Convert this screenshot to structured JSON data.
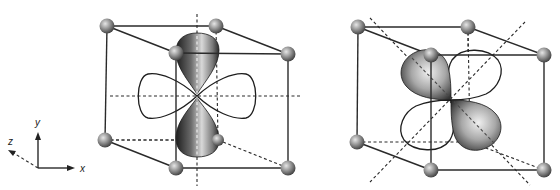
{
  "figure": {
    "panels": [
      {
        "id": "left",
        "orbital": "d_z2-like lobes along vertical axis with torus-like ring",
        "shaded_lobes": "up and down along y axis",
        "outlined_lobes": "left and right along x axis"
      },
      {
        "id": "right",
        "orbital": "d_xy-like lobes between axes",
        "shaded_lobes": "upper-left and lower-right diagonals",
        "outlined_lobes": "upper-right and lower-left diagonals"
      }
    ],
    "axes": {
      "x_label": "x",
      "y_label": "y",
      "z_label": "z"
    },
    "colors": {
      "line": "#2a2a2a",
      "atom_dark": "#3a3a3a",
      "atom_light": "#d9d9d9",
      "lobe_dark": "#1f1f1f",
      "lobe_light": "#e8e8e8"
    }
  }
}
